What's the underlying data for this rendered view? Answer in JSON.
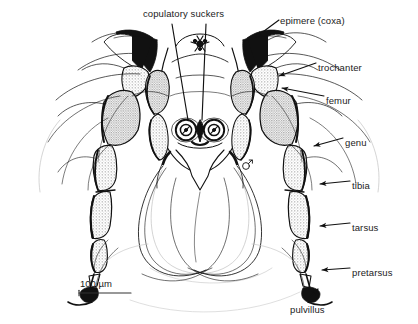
{
  "figure": {
    "background_color": "#ffffff",
    "ink_color": "#111111",
    "stipple_color": "#9a9a9a",
    "label_color": "#1b1b1b"
  },
  "labels": [
    {
      "id": "copulatory-suckers",
      "text": "copulatory suckers",
      "x": 143,
      "y": 9,
      "anchor": "start"
    },
    {
      "id": "epimere-coxa",
      "text": "epimere (coxa)",
      "x": 280,
      "y": 16,
      "anchor": "start"
    },
    {
      "id": "trochanter",
      "text": "trochanter",
      "x": 318,
      "y": 63,
      "anchor": "start"
    },
    {
      "id": "femur",
      "text": "femur",
      "x": 326,
      "y": 96,
      "anchor": "start"
    },
    {
      "id": "genu",
      "text": "genu",
      "x": 345,
      "y": 138,
      "anchor": "start"
    },
    {
      "id": "tibia",
      "text": "tibia",
      "x": 352,
      "y": 181,
      "anchor": "start"
    },
    {
      "id": "tarsus",
      "text": "tarsus",
      "x": 352,
      "y": 223,
      "anchor": "start"
    },
    {
      "id": "pretarsus",
      "text": "pretarsus",
      "x": 352,
      "y": 268,
      "anchor": "start"
    },
    {
      "id": "pulvillus",
      "text": "pulvillus",
      "x": 290,
      "y": 305,
      "anchor": "start"
    }
  ],
  "scale_bar": {
    "text": "100 µm",
    "label_x": 80,
    "label_y": 278,
    "line_x1": 79,
    "line_x2": 131,
    "line_y": 293
  },
  "leaders": [
    {
      "id": "leader-suckers-left",
      "from": [
        168,
        22
      ],
      "to": [
        189,
        124
      ]
    },
    {
      "id": "leader-suckers-right",
      "from": [
        209,
        22
      ],
      "to": [
        202,
        124
      ]
    },
    {
      "id": "leader-epimere",
      "from": [
        278,
        22
      ],
      "to": [
        252,
        40
      ]
    },
    {
      "id": "leader-trochanter",
      "from": [
        316,
        66
      ],
      "to": [
        281,
        78
      ]
    },
    {
      "id": "leader-femur",
      "from": [
        324,
        99
      ],
      "to": [
        283,
        88
      ]
    },
    {
      "id": "leader-genu",
      "from": [
        343,
        141
      ],
      "to": [
        312,
        145
      ]
    },
    {
      "id": "leader-tibia",
      "from": [
        350,
        184
      ],
      "to": [
        318,
        186
      ]
    },
    {
      "id": "leader-tarsus",
      "from": [
        350,
        226
      ],
      "to": [
        320,
        228
      ]
    },
    {
      "id": "leader-pretarsus",
      "from": [
        350,
        271
      ],
      "to": [
        322,
        272
      ]
    },
    {
      "id": "leader-pulvillus",
      "from": [
        306,
        300
      ],
      "to": [
        318,
        288
      ]
    }
  ],
  "anatomy": {
    "sucker_left_center": [
      186,
      130
    ],
    "sucker_right_center": [
      214,
      130
    ],
    "sucker_outer_radius": 13,
    "sucker_inner_radius": 7,
    "body_axis_x": 200,
    "sex_symbol": "♂",
    "sex_symbol_x": 248,
    "sex_symbol_y": 162
  }
}
